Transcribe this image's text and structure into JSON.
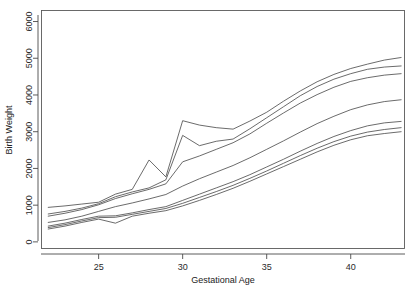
{
  "figure": {
    "background_color": "#ffffff",
    "line_color": "#3a3a3a",
    "axis_color": "#4a4a4a",
    "partial_title": ""
  },
  "axes": {
    "x_title": "Gestational Age",
    "y_title": "Birth Weight",
    "x_ticks": [
      "25",
      "30",
      "35",
      "40"
    ],
    "y_ticks": [
      "0",
      "1000",
      "2000",
      "3000",
      "4000",
      "5000",
      "6000"
    ]
  },
  "chart_data": {
    "type": "line",
    "title": "",
    "xlabel": "Gestational Age",
    "ylabel": "Birth Weight",
    "xlim": [
      21.6,
      43.2
    ],
    "ylim": [
      -180,
      6300
    ],
    "xticks": [
      25,
      30,
      35,
      40
    ],
    "yticks": [
      0,
      1000,
      2000,
      3000,
      4000,
      5000,
      6000
    ],
    "grid": false,
    "legend": "none",
    "x": [
      22,
      23,
      24,
      25,
      26,
      27,
      28,
      29,
      30,
      31,
      32,
      33,
      34,
      35,
      36,
      37,
      38,
      39,
      40,
      41,
      42,
      43
    ],
    "series": [
      {
        "name": "curve-1-upper",
        "values": [
          940,
          980,
          1030,
          1080,
          1300,
          1430,
          2230,
          1770,
          3300,
          3180,
          3110,
          3070,
          3290,
          3530,
          3830,
          4110,
          4360,
          4560,
          4720,
          4840,
          4950,
          5020
        ]
      },
      {
        "name": "curve-2-upper",
        "values": [
          760,
          830,
          920,
          1040,
          1230,
          1360,
          1470,
          1690,
          2900,
          2620,
          2740,
          2800,
          3080,
          3380,
          3680,
          3980,
          4230,
          4430,
          4580,
          4700,
          4760,
          4790
        ]
      },
      {
        "name": "curve-3-upper",
        "values": [
          700,
          780,
          880,
          1010,
          1180,
          1310,
          1430,
          1580,
          2180,
          2340,
          2520,
          2700,
          2940,
          3230,
          3510,
          3780,
          4010,
          4210,
          4370,
          4470,
          4540,
          4580
        ]
      },
      {
        "name": "curve-4-middle",
        "values": [
          530,
          600,
          700,
          830,
          960,
          1060,
          1170,
          1290,
          1520,
          1720,
          1900,
          2080,
          2290,
          2520,
          2750,
          2990,
          3220,
          3420,
          3600,
          3730,
          3820,
          3870
        ]
      },
      {
        "name": "curve-5-lower",
        "values": [
          430,
          510,
          610,
          700,
          710,
          790,
          880,
          960,
          1130,
          1300,
          1470,
          1640,
          1830,
          2040,
          2250,
          2470,
          2680,
          2870,
          3030,
          3160,
          3240,
          3280
        ]
      },
      {
        "name": "curve-6-lower",
        "values": [
          390,
          470,
          570,
          660,
          670,
          750,
          830,
          910,
          1050,
          1210,
          1370,
          1540,
          1730,
          1930,
          2140,
          2350,
          2550,
          2730,
          2880,
          2990,
          3060,
          3110
        ]
      },
      {
        "name": "curve-7-lower",
        "values": [
          350,
          430,
          530,
          620,
          510,
          700,
          780,
          850,
          980,
          1130,
          1290,
          1460,
          1650,
          1850,
          2050,
          2250,
          2450,
          2630,
          2780,
          2890,
          2950,
          3000
        ]
      }
    ]
  }
}
